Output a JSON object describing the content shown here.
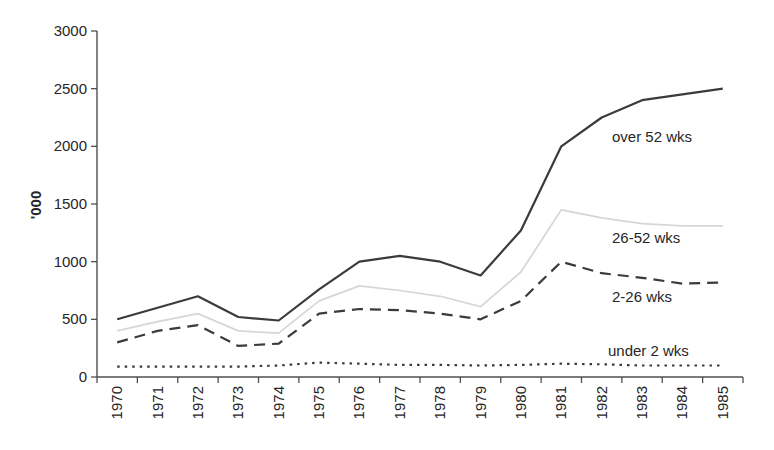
{
  "figure": {
    "background": "#ffffff",
    "title": ""
  },
  "chart_data": {
    "type": "line",
    "title": "",
    "xlabel": "",
    "ylabel": "'000",
    "categories": [
      "1970",
      "1971",
      "1972",
      "1973",
      "1974",
      "1975",
      "1976",
      "1977",
      "1978",
      "1979",
      "1980",
      "1981",
      "1982",
      "1983",
      "1984",
      "1985"
    ],
    "ylim": [
      0,
      3000
    ],
    "yticks": [
      0,
      500,
      1000,
      1500,
      2000,
      2500,
      3000
    ],
    "grid": false,
    "legend_position": "inline-labels",
    "axis_color": "#4f4f4f",
    "text_color": "#262626",
    "series": [
      {
        "name": "over 52 wks",
        "line_style": "solid",
        "color": "#3b3b3b",
        "width": 2.2,
        "values": [
          500,
          600,
          700,
          520,
          490,
          760,
          1000,
          1050,
          1000,
          880,
          1270,
          2000,
          2250,
          2400,
          2450,
          2500
        ]
      },
      {
        "name": "26-52 wks",
        "line_style": "solid",
        "color": "#d6d6d6",
        "width": 1.7,
        "values": [
          400,
          480,
          550,
          400,
          380,
          660,
          790,
          750,
          700,
          610,
          910,
          1450,
          1380,
          1330,
          1310,
          1310
        ]
      },
      {
        "name": "2-26 wks",
        "line_style": "dashed",
        "color": "#3b3b3b",
        "width": 2.2,
        "values": [
          300,
          400,
          450,
          270,
          290,
          550,
          590,
          580,
          550,
          500,
          660,
          1000,
          900,
          860,
          810,
          820
        ]
      },
      {
        "name": "under 2 wks",
        "line_style": "dotted",
        "color": "#3b3b3b",
        "width": 2.2,
        "values": [
          90,
          90,
          90,
          90,
          100,
          125,
          115,
          105,
          105,
          100,
          105,
          115,
          110,
          100,
          100,
          100
        ]
      }
    ],
    "series_labels": [
      {
        "text": "over 52 wks",
        "x": 612,
        "y": 142
      },
      {
        "text": "26-52 wks",
        "x": 612,
        "y": 243
      },
      {
        "text": "2-26 wks",
        "x": 612,
        "y": 302
      },
      {
        "text": "under 2 wks",
        "x": 608,
        "y": 356
      }
    ]
  }
}
